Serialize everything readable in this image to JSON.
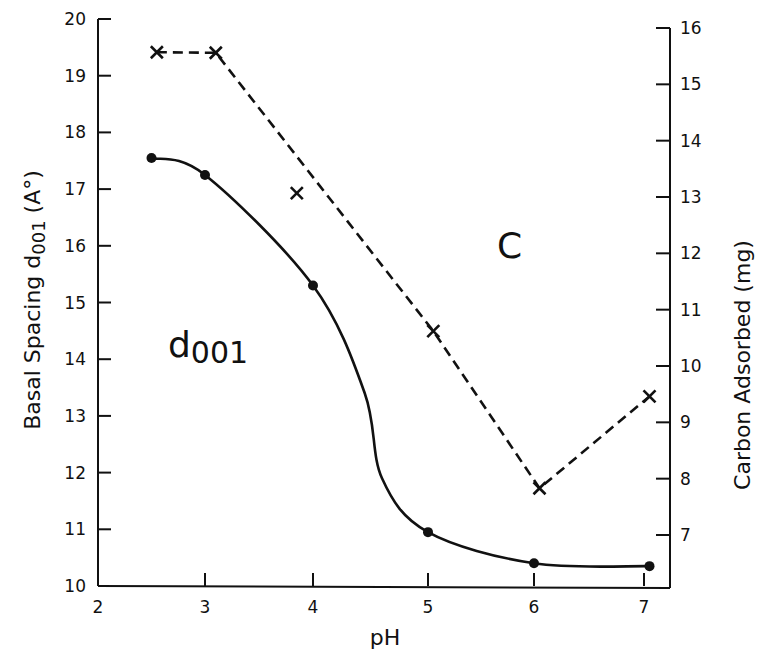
{
  "chart_data": {
    "type": "line",
    "title": "",
    "xlabel": "pH",
    "ylabel": "Basal Spacing d001 (A°)",
    "ylabel_right": "Carbon Adsorbed (mg)",
    "xlim": [
      2,
      7.25
    ],
    "ylim": [
      10,
      20
    ],
    "ylim_right": [
      6.5,
      16
    ],
    "x_ticks": [
      2,
      3,
      4,
      5,
      6,
      7
    ],
    "y_ticks": [
      10,
      11,
      12,
      13,
      14,
      15,
      16,
      17,
      18,
      19,
      20
    ],
    "y_ticks_right": [
      7,
      8,
      9,
      10,
      11,
      12,
      13,
      14,
      15,
      16
    ],
    "grid": false,
    "legend": "none",
    "annotations": [
      {
        "text": "d001",
        "x": 3.0,
        "y": 14.0,
        "series": "Basal Spacing d001"
      },
      {
        "text": "C",
        "x": 5.9,
        "y": 16.2,
        "series": "Carbon Adsorbed"
      }
    ],
    "series": [
      {
        "name": "Basal Spacing d001",
        "axis": "left",
        "style": "solid smoothed line, filled circle markers",
        "x": [
          2.5,
          3.0,
          4.0,
          5.0,
          6.0,
          7.05
        ],
        "values": [
          17.55,
          17.25,
          15.3,
          10.95,
          10.4,
          10.35
        ]
      },
      {
        "name": "Carbon Adsorbed",
        "axis": "right",
        "style": "dashed line, x markers",
        "x": [
          2.55,
          3.1,
          3.85,
          5.05,
          6.05,
          7.05
        ],
        "values": [
          15.57,
          15.56,
          13.07,
          10.62,
          7.83,
          9.46
        ]
      }
    ]
  },
  "labels": {
    "xlabel": "pH",
    "ylabel_left_main": "Basal  Spacing  d",
    "ylabel_left_sub": "001",
    "ylabel_left_unit": " (A°)",
    "ylabel_right": "Carbon  Adsorbed   (mg)",
    "annot_d_main": "d",
    "annot_d_sub": "001",
    "annot_c": "C"
  }
}
